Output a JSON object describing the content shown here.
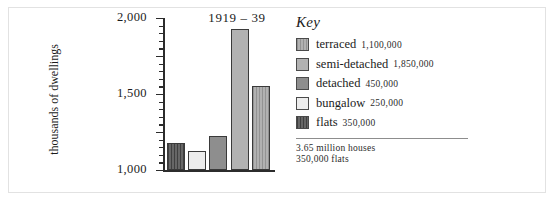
{
  "chart_data": {
    "type": "bar",
    "title": "1919 – 39",
    "xlabel": "",
    "ylabel": "thousands of dwellings",
    "ylim": [
      0,
      2000
    ],
    "yticks": [
      0,
      500,
      1000,
      1500,
      2000
    ],
    "ytick_labels": [
      "0",
      "500",
      "1,000",
      "1,500",
      "2,000"
    ],
    "minor_tick_step": 100,
    "grid": false,
    "legend_position": "right",
    "categories": [
      "flats",
      "bungalow",
      "detached",
      "semi-detached",
      "terraced"
    ],
    "values": [
      350,
      250,
      450,
      1850,
      1100
    ],
    "bars": [
      {
        "name": "flats",
        "value": 350,
        "fill": "#5b5b5b",
        "pattern": "vertical-hatch"
      },
      {
        "name": "bungalow",
        "value": 250,
        "fill": "#ececec",
        "pattern": "solid"
      },
      {
        "name": "detached",
        "value": 450,
        "fill": "#8e8e8e",
        "pattern": "solid"
      },
      {
        "name": "semi-detached",
        "value": 1850,
        "fill": "#b2b2b2",
        "pattern": "solid"
      },
      {
        "name": "terraced",
        "value": 1100,
        "fill": "#a8a8a8",
        "pattern": "vertical-hatch"
      }
    ]
  },
  "legend": {
    "title": "Key",
    "items": [
      {
        "label": "terraced",
        "value": "1,100,000",
        "fill": "#a8a8a8",
        "pattern": "vertical-hatch"
      },
      {
        "label": "semi-detached",
        "value": "1,850,000",
        "fill": "#b2b2b2",
        "pattern": "solid"
      },
      {
        "label": "detached",
        "value": "450,000",
        "fill": "#8e8e8e",
        "pattern": "solid"
      },
      {
        "label": "bungalow",
        "value": "250,000",
        "fill": "#ececec",
        "pattern": "solid"
      },
      {
        "label": "flats",
        "value": "350,000",
        "fill": "#5b5b5b",
        "pattern": "vertical-hatch"
      }
    ],
    "footnotes": [
      "3.65 million houses",
      "350,000 flats"
    ]
  },
  "colors": {
    "ink": "#1b1b1b",
    "axis": "#2c2c2c",
    "frame": "#e2e2e2",
    "rule": "#8d8d8d",
    "background": "#ffffff"
  }
}
